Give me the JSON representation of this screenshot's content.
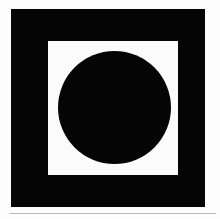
{
  "figure": {
    "background_color": "#fdfdfd",
    "page_background": "#ffffff"
  },
  "shapes": {
    "outer_square": {
      "name": "outer-square",
      "type": "square",
      "color": "#050505",
      "x": 11,
      "y": 9,
      "width": 194,
      "height": 198
    },
    "inner_square": {
      "name": "inner-square",
      "type": "square",
      "color": "#fbfbfb",
      "x": 48,
      "y": 41,
      "width": 130,
      "height": 134
    },
    "inner_circle": {
      "name": "inner-circle",
      "type": "circle",
      "color": "#050505",
      "center_x": 114,
      "center_y": 107,
      "diameter": 113
    }
  },
  "separator": {
    "name": "separator-rule",
    "color": "#b9b9b9",
    "x": 10,
    "y": 213,
    "width": 206,
    "height": 1
  }
}
